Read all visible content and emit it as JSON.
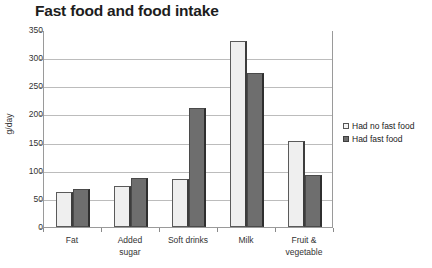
{
  "chart_data": {
    "type": "bar",
    "title": "Fast food and food intake",
    "xlabel": "",
    "ylabel": "g/day",
    "ylim": [
      0,
      350
    ],
    "ytick_step": 50,
    "yticks": [
      0,
      50,
      100,
      150,
      200,
      250,
      300,
      350
    ],
    "grid": true,
    "legend_position": "right",
    "categories": [
      "Fat",
      "Added\nsugar",
      "Soft drinks",
      "Milk",
      "Fruit &\nvegetable"
    ],
    "series": [
      {
        "name": "Had no fast food",
        "color": "#efefef",
        "values": [
          62,
          73,
          86,
          330,
          152
        ]
      },
      {
        "name": "Had fast food",
        "color": "#6e6e6e",
        "values": [
          67,
          87,
          212,
          273,
          92
        ]
      }
    ]
  },
  "legend": {
    "items": [
      {
        "label": "Had no fast food",
        "swatch": "light"
      },
      {
        "label": "Had fast food",
        "swatch": "dark"
      }
    ]
  }
}
